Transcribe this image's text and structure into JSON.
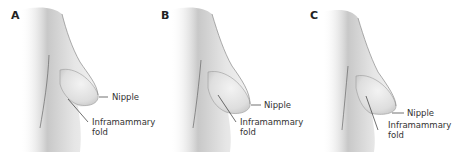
{
  "figure": {
    "panels": [
      {
        "letter": "A",
        "nipple_label": "Nipple",
        "fold_label_line1": "Inframammary",
        "fold_label_line2": "fold"
      },
      {
        "letter": "B",
        "nipple_label": "Nipple",
        "fold_label_line1": "Inframammary",
        "fold_label_line2": "fold"
      },
      {
        "letter": "C",
        "nipple_label": "Nipple",
        "fold_label_line1": "Inframammary",
        "fold_label_line2": "fold"
      }
    ]
  }
}
